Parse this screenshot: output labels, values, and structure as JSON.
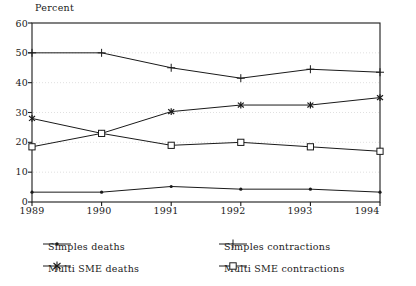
{
  "chart_data": {
    "type": "line",
    "title": "",
    "subtitle": "",
    "ylabel": "Percent",
    "xlabel": "",
    "x": [
      "1989",
      "1990",
      "1991",
      "1992",
      "1993",
      "1994"
    ],
    "categories": [
      "1989",
      "1990",
      "1991",
      "1992",
      "1993",
      "1994"
    ],
    "ylim": [
      0,
      60
    ],
    "yticks": [
      0,
      10,
      20,
      30,
      40,
      50,
      60
    ],
    "ytick_labels": [
      "0",
      "10",
      "20",
      "30",
      "40",
      "50",
      "60"
    ],
    "grid": "horizontal-dashed-light",
    "legend_position": "bottom",
    "series": [
      {
        "name": "Simples deaths",
        "marker": "dot",
        "values": [
          3.3,
          3.3,
          5.2,
          4.3,
          4.3,
          3.3
        ]
      },
      {
        "name": "Simples contractions",
        "marker": "plus",
        "values": [
          50.0,
          50.0,
          45.0,
          41.5,
          44.5,
          43.5
        ]
      },
      {
        "name": "Multi SME deaths",
        "marker": "asterisk",
        "values": [
          28.0,
          23.0,
          30.3,
          32.5,
          32.5,
          35.0
        ]
      },
      {
        "name": "Multi SME contractions",
        "marker": "square",
        "values": [
          18.5,
          23.0,
          19.0,
          20.0,
          18.5,
          17.0
        ]
      }
    ],
    "colors": {
      "line": "#1a1a1a",
      "grid": "#d8d8d8",
      "axis": "#1a1a1a",
      "background": "#ffffff"
    }
  },
  "legend": {
    "items": [
      {
        "label": "Simples deaths",
        "marker": "dot"
      },
      {
        "label": "Simples contractions",
        "marker": "plus"
      },
      {
        "label": "Multi SME deaths",
        "marker": "asterisk"
      },
      {
        "label": "Multi SME contractions",
        "marker": "square"
      }
    ]
  }
}
